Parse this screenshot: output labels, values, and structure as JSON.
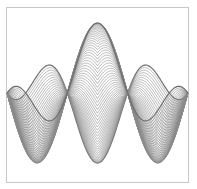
{
  "chart_data": {
    "type": "line",
    "title": "",
    "xlabel": "",
    "ylabel": "",
    "grid": false,
    "legend": null,
    "x_range": [
      0,
      9.42477796
    ],
    "y_range": [
      -1,
      1
    ],
    "params": {
      "curve_count": 60,
      "c": 0.42,
      "t_start": 0,
      "t_end": 3.14159265,
      "samples": 180
    },
    "style": {
      "line_color": "#8a8a8a",
      "envelope_color": "#6e6e6e",
      "frame_color": "#c8c8c8",
      "background": "#ffffff"
    },
    "frame": {
      "left": 6,
      "top": 7,
      "right": 188,
      "bottom": 182
    },
    "plot_mapping": {
      "x0_px": 7,
      "x_px_per_unit": 19.2,
      "y0_px": 93,
      "y_px_per_unit": 70
    }
  }
}
